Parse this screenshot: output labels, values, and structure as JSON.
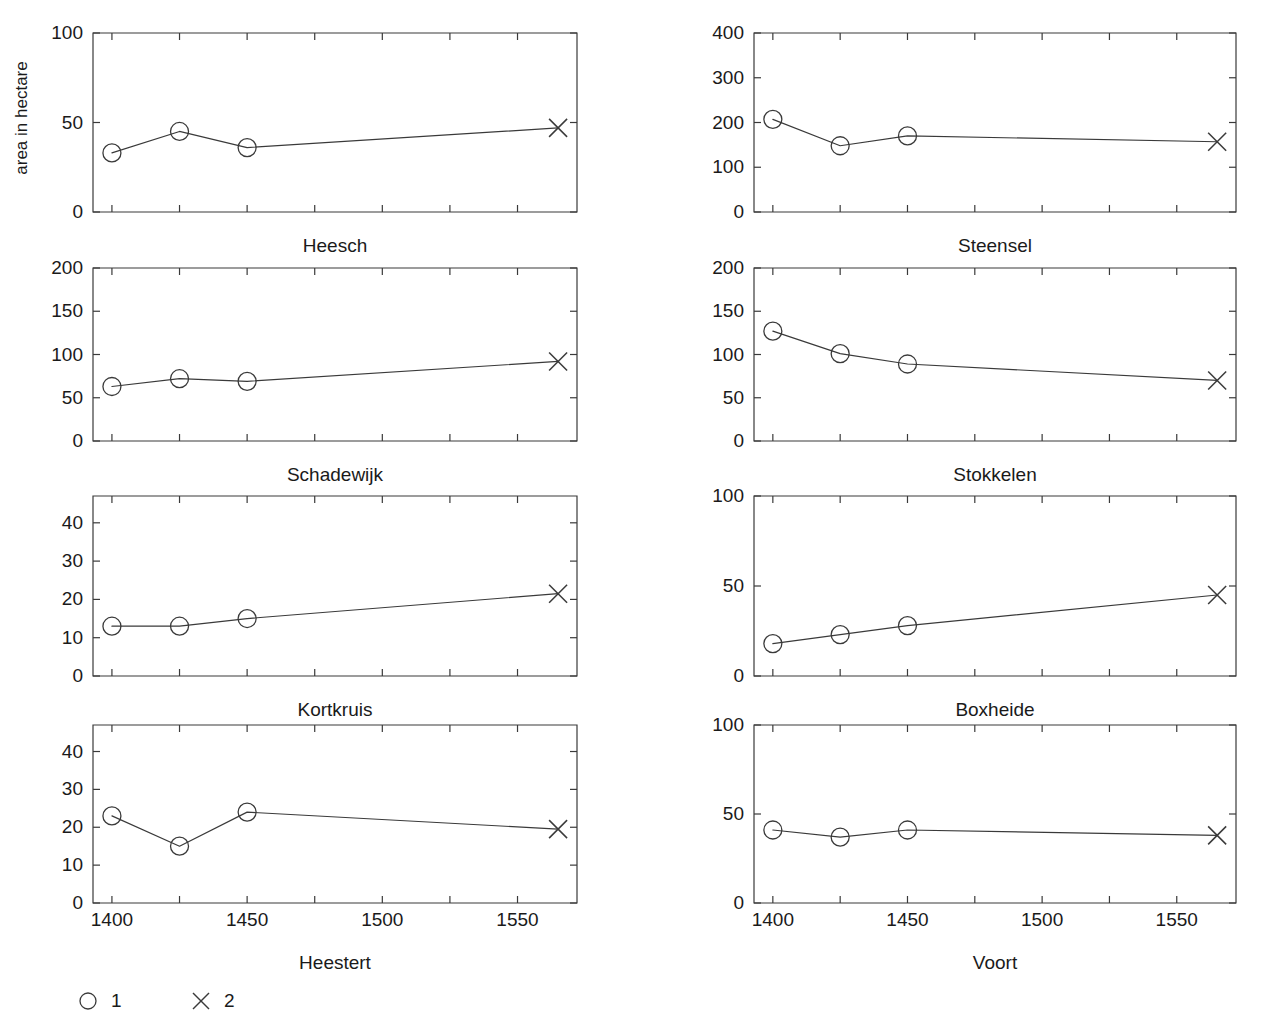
{
  "figure": {
    "y_axis_title": "area in hectare",
    "background_color": "#ffffff",
    "ink_color": "#3a3a3a",
    "text_color": "#1a1a1a"
  },
  "legend": {
    "position": "bottom-left",
    "entries": [
      {
        "marker": "circle-marker",
        "label": "1"
      },
      {
        "marker": "cross-marker",
        "label": "2"
      }
    ]
  },
  "chart_data": [
    {
      "type": "line",
      "title": "Heesch",
      "xlabel": "",
      "ylabel": "area in hectare",
      "x": [
        1400,
        1425,
        1450,
        1565
      ],
      "values": [
        33,
        45,
        36,
        47
      ],
      "point_markers": [
        "circle",
        "circle",
        "circle",
        "cross"
      ],
      "xlim": [
        1393,
        1572
      ],
      "ylim": [
        0,
        100
      ],
      "yticks": [
        0,
        50,
        100
      ],
      "ytick_labels": [
        "0",
        "50",
        "100"
      ],
      "xticks": [
        1400,
        1425,
        1450,
        1475,
        1500,
        1525,
        1550
      ],
      "xtick_labels": [
        "",
        "",
        "",
        "",
        "",
        "",
        ""
      ],
      "grid": false,
      "legend": "none"
    },
    {
      "type": "line",
      "title": "Steensel",
      "xlabel": "",
      "ylabel": "",
      "x": [
        1400,
        1425,
        1450,
        1565
      ],
      "values": [
        207,
        148,
        170,
        157
      ],
      "point_markers": [
        "circle",
        "circle",
        "circle",
        "cross"
      ],
      "xlim": [
        1393,
        1572
      ],
      "ylim": [
        0,
        400
      ],
      "yticks": [
        0,
        100,
        200,
        300,
        400
      ],
      "ytick_labels": [
        "0",
        "100",
        "200",
        "300",
        "400"
      ],
      "xticks": [
        1400,
        1425,
        1450,
        1475,
        1500,
        1525,
        1550
      ],
      "xtick_labels": [
        "",
        "",
        "",
        "",
        "",
        "",
        ""
      ],
      "grid": false,
      "legend": "none"
    },
    {
      "type": "line",
      "title": "Schadewijk",
      "xlabel": "",
      "ylabel": "",
      "x": [
        1400,
        1425,
        1450,
        1565
      ],
      "values": [
        63,
        72,
        69,
        92
      ],
      "point_markers": [
        "circle",
        "circle",
        "circle",
        "cross"
      ],
      "xlim": [
        1393,
        1572
      ],
      "ylim": [
        0,
        200
      ],
      "yticks": [
        0,
        50,
        100,
        150,
        200
      ],
      "ytick_labels": [
        "0",
        "50",
        "100",
        "150",
        "200"
      ],
      "xticks": [
        1400,
        1425,
        1450,
        1475,
        1500,
        1525,
        1550
      ],
      "xtick_labels": [
        "",
        "",
        "",
        "",
        "",
        "",
        ""
      ],
      "grid": false,
      "legend": "none"
    },
    {
      "type": "line",
      "title": "Stokkelen",
      "xlabel": "",
      "ylabel": "",
      "x": [
        1400,
        1425,
        1450,
        1565
      ],
      "values": [
        127,
        101,
        89,
        70
      ],
      "point_markers": [
        "circle",
        "circle",
        "circle",
        "cross"
      ],
      "xlim": [
        1393,
        1572
      ],
      "ylim": [
        0,
        200
      ],
      "yticks": [
        0,
        50,
        100,
        150,
        200
      ],
      "ytick_labels": [
        "0",
        "50",
        "100",
        "150",
        "200"
      ],
      "xticks": [
        1400,
        1425,
        1450,
        1475,
        1500,
        1525,
        1550
      ],
      "xtick_labels": [
        "",
        "",
        "",
        "",
        "",
        "",
        ""
      ],
      "grid": false,
      "legend": "none"
    },
    {
      "type": "line",
      "title": "Kortkruis",
      "xlabel": "",
      "ylabel": "",
      "x": [
        1400,
        1425,
        1450,
        1565
      ],
      "values": [
        13,
        13,
        15,
        21.5
      ],
      "point_markers": [
        "circle",
        "circle",
        "circle",
        "cross"
      ],
      "xlim": [
        1393,
        1572
      ],
      "ylim": [
        0,
        47
      ],
      "yticks": [
        0,
        10,
        20,
        30,
        40
      ],
      "ytick_labels": [
        "0",
        "10",
        "20",
        "30",
        "40"
      ],
      "xticks": [
        1400,
        1425,
        1450,
        1475,
        1500,
        1525,
        1550
      ],
      "xtick_labels": [
        "",
        "",
        "",
        "",
        "",
        "",
        ""
      ],
      "grid": false,
      "legend": "none"
    },
    {
      "type": "line",
      "title": "Boxheide",
      "xlabel": "",
      "ylabel": "",
      "x": [
        1400,
        1425,
        1450,
        1565
      ],
      "values": [
        18,
        23,
        28,
        45
      ],
      "point_markers": [
        "circle",
        "circle",
        "circle",
        "cross"
      ],
      "xlim": [
        1393,
        1572
      ],
      "ylim": [
        0,
        100
      ],
      "yticks": [
        0,
        50,
        100
      ],
      "ytick_labels": [
        "0",
        "50",
        "100"
      ],
      "xticks": [
        1400,
        1425,
        1450,
        1475,
        1500,
        1525,
        1550
      ],
      "xtick_labels": [
        "",
        "",
        "",
        "",
        "",
        "",
        ""
      ],
      "grid": false,
      "legend": "none"
    },
    {
      "type": "line",
      "title": "Heestert",
      "xlabel": "",
      "ylabel": "",
      "x": [
        1400,
        1425,
        1450,
        1565
      ],
      "values": [
        23,
        15,
        24,
        19.5
      ],
      "point_markers": [
        "circle",
        "circle",
        "circle",
        "cross"
      ],
      "xlim": [
        1393,
        1572
      ],
      "ylim": [
        0,
        47
      ],
      "yticks": [
        0,
        10,
        20,
        30,
        40
      ],
      "ytick_labels": [
        "0",
        "10",
        "20",
        "30",
        "40"
      ],
      "xticks": [
        1400,
        1425,
        1450,
        1475,
        1500,
        1525,
        1550
      ],
      "xtick_labels": [
        "1400",
        "",
        "1450",
        "",
        "1500",
        "",
        "1550"
      ],
      "grid": false,
      "legend": "none"
    },
    {
      "type": "line",
      "title": "Voort",
      "xlabel": "",
      "ylabel": "",
      "x": [
        1400,
        1425,
        1450,
        1565
      ],
      "values": [
        41,
        37,
        41,
        38
      ],
      "point_markers": [
        "circle",
        "circle",
        "circle",
        "cross"
      ],
      "xlim": [
        1393,
        1572
      ],
      "ylim": [
        0,
        100
      ],
      "yticks": [
        0,
        50,
        100
      ],
      "ytick_labels": [
        "0",
        "50",
        "100"
      ],
      "xticks": [
        1400,
        1425,
        1450,
        1475,
        1500,
        1525,
        1550
      ],
      "xtick_labels": [
        "1400",
        "",
        "1450",
        "",
        "1500",
        "",
        "1550"
      ],
      "grid": false,
      "legend": "none"
    }
  ],
  "layout": {
    "panel_boxes": [
      {
        "left": 93,
        "top": 33,
        "right": 577,
        "bottom": 212
      },
      {
        "left": 754,
        "top": 33,
        "right": 1236,
        "bottom": 212
      },
      {
        "left": 93,
        "top": 268,
        "right": 577,
        "bottom": 441
      },
      {
        "left": 754,
        "top": 268,
        "right": 1236,
        "bottom": 441
      },
      {
        "left": 93,
        "top": 496,
        "right": 577,
        "bottom": 676
      },
      {
        "left": 754,
        "top": 496,
        "right": 1236,
        "bottom": 676
      },
      {
        "left": 93,
        "top": 725,
        "right": 577,
        "bottom": 903
      },
      {
        "left": 754,
        "top": 725,
        "right": 1236,
        "bottom": 903
      }
    ],
    "title_offsets": [
      26,
      26,
      26,
      26,
      26,
      26,
      52,
      52
    ],
    "show_xticklabels": [
      false,
      false,
      false,
      false,
      false,
      false,
      true,
      true
    ],
    "y_axis_title_pos": {
      "x": 27,
      "y": 118
    },
    "legend_pos": {
      "x": 88,
      "y": 1001
    },
    "legend_spacing": 113,
    "legend_label_dx": 23
  }
}
